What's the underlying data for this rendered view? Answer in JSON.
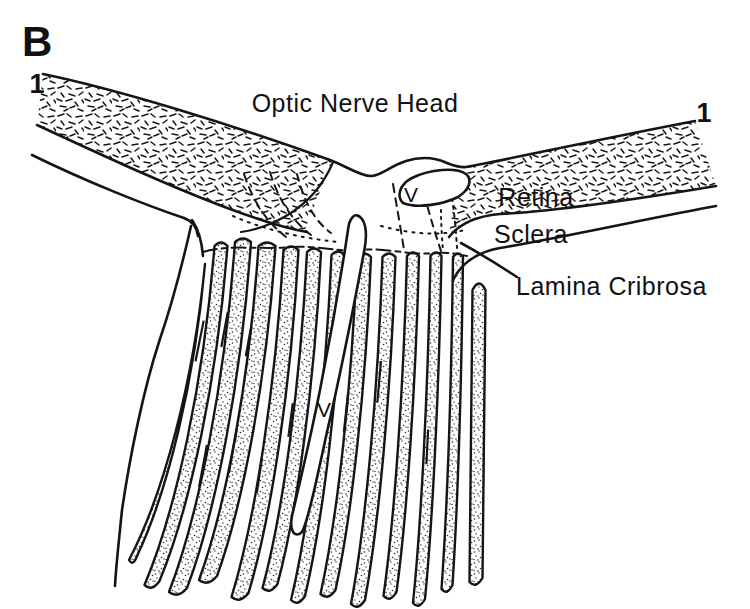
{
  "figure": {
    "panel_label": "B",
    "section_marker_left": "1",
    "section_marker_right": "1",
    "title": "Optic Nerve Head",
    "labels": {
      "retina": "Retina",
      "sclera": "Sclera",
      "lamina_cribrosa": "Lamina Cribrosa",
      "vessel_top": "V",
      "vessel_central": "V"
    },
    "colors": {
      "ink": "#151515",
      "background": "#ffffff"
    }
  }
}
